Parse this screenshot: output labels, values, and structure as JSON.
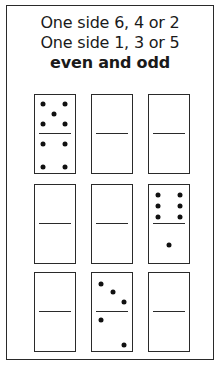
{
  "title": {
    "line1": "One side 6, 4 or 2",
    "line2": "One side 1, 3 or 5",
    "line3": "even and odd"
  },
  "dominoes": [
    {
      "row": 1,
      "col": 1,
      "top": 5,
      "bottom": 4
    },
    {
      "row": 1,
      "col": 2,
      "top": null,
      "bottom": null
    },
    {
      "row": 1,
      "col": 3,
      "top": null,
      "bottom": null
    },
    {
      "row": 2,
      "col": 1,
      "top": null,
      "bottom": null
    },
    {
      "row": 2,
      "col": 2,
      "top": null,
      "bottom": null
    },
    {
      "row": 2,
      "col": 3,
      "top": 6,
      "bottom": 1
    },
    {
      "row": 3,
      "col": 1,
      "top": null,
      "bottom": null
    },
    {
      "row": 3,
      "col": 2,
      "top": 3,
      "bottom": 2
    },
    {
      "row": 3,
      "col": 3,
      "top": null,
      "bottom": null
    }
  ]
}
